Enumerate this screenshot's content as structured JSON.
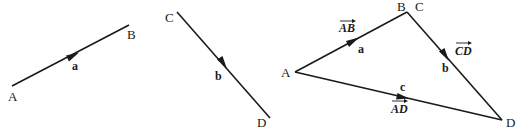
{
  "figure_1": {
    "start_label": "A",
    "end_label": "B",
    "vector_label": "a"
  },
  "figure_2": {
    "start_label": "C",
    "end_label": "D",
    "vector_label": "b"
  },
  "figure_3": {
    "vertices": {
      "A": "A",
      "B": "B",
      "C": "C",
      "D": "D"
    },
    "vectors": [
      {
        "name": "AB",
        "label": "a"
      },
      {
        "name": "CD",
        "label": "b"
      },
      {
        "name": "AD",
        "label": "c"
      }
    ]
  },
  "colors": {
    "stroke": "#1a1a1a",
    "background": "#ffffff"
  }
}
